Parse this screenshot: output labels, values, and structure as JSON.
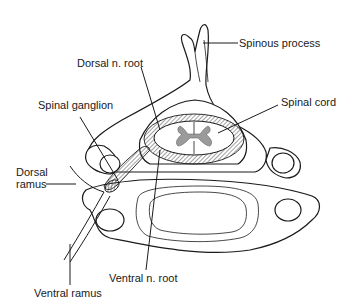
{
  "figure": {
    "labels": {
      "spinous_process": "Spinous process",
      "dorsal_n_root": "Dorsal n. root",
      "spinal_ganglion": "Spinal ganglion",
      "spinal_cord": "Spinal cord",
      "dorsal_ramus_line1": "Dorsal",
      "dorsal_ramus_line2": "ramus",
      "ventral_n_root": "Ventral n. root",
      "ventral_ramus": "Ventral ramus"
    },
    "colors": {
      "line": "#1a1a1a",
      "background": "#ffffff",
      "gray_matter": "#9a9a9a"
    }
  }
}
